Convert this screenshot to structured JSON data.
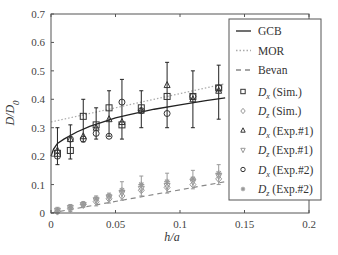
{
  "chart_data": {
    "type": "scatter",
    "title": "",
    "xlabel": "h/a",
    "ylabel": "D/D0",
    "ylabel_main": "D/D",
    "ylabel_sub": "0",
    "xlim": [
      0,
      0.2
    ],
    "ylim": [
      0,
      0.7
    ],
    "xticks": [
      0,
      0.05,
      0.1,
      0.15,
      0.2
    ],
    "xtick_labels": [
      "0",
      "0.05",
      "0.1",
      "0.15",
      "0.2"
    ],
    "yticks": [
      0,
      0.1,
      0.2,
      0.3,
      0.4,
      0.5,
      0.6,
      0.7
    ],
    "ytick_labels": [
      "0",
      "0.1",
      "0.2",
      "0.3",
      "0.4",
      "0.5",
      "0.6",
      "0.7"
    ],
    "grid": false,
    "legend_position": "upper right (outside plot edge)",
    "x": [
      0.005,
      0.015,
      0.025,
      0.035,
      0.045,
      0.055,
      0.07,
      0.09,
      0.11,
      0.13
    ],
    "lines": [
      {
        "name": "GCB",
        "style": "solid",
        "color": "#222222",
        "x": [
          0,
          0.002,
          0.005,
          0.01,
          0.02,
          0.03,
          0.04,
          0.05,
          0.06,
          0.08,
          0.1,
          0.12,
          0.135
        ],
        "y": [
          0.2,
          0.225,
          0.245,
          0.26,
          0.285,
          0.305,
          0.32,
          0.335,
          0.345,
          0.365,
          0.38,
          0.395,
          0.405
        ]
      },
      {
        "name": "MOR",
        "style": "dotted",
        "color": "#aaaaaa",
        "x": [
          0,
          0.135
        ],
        "y": [
          0.32,
          0.455
        ]
      },
      {
        "name": "Bevan",
        "style": "dashed",
        "color": "#888888",
        "x": [
          0,
          0.135
        ],
        "y": [
          0.0,
          0.11
        ]
      }
    ],
    "series": [
      {
        "name": "Dx (Sim.)",
        "label_main": "D",
        "label_sub": "x",
        "label_rest": " (Sim.)",
        "marker": "square",
        "color": "#333333",
        "values": [
          0.21,
          0.22,
          0.34,
          0.31,
          0.37,
          0.31,
          0.37,
          0.41,
          0.41,
          0.44
        ]
      },
      {
        "name": "Dz (Sim.)",
        "label_main": "D",
        "label_sub": "z",
        "label_rest": " (Sim.)",
        "marker": "diamond",
        "color": "#999999",
        "values": [
          0.005,
          0.015,
          0.03,
          0.04,
          0.05,
          0.06,
          0.08,
          0.09,
          0.1,
          0.12
        ]
      },
      {
        "name": "Dx (Exp.#1)",
        "label_main": "D",
        "label_sub": "x",
        "label_rest": " (Exp.#1)",
        "marker": "triangle-up",
        "color": "#333333",
        "values": [
          0.22,
          0.26,
          0.27,
          0.3,
          0.33,
          0.32,
          0.36,
          0.45,
          0.4,
          0.43
        ]
      },
      {
        "name": "Dz (Exp.#1)",
        "label_main": "D",
        "label_sub": "z",
        "label_rest": " (Exp.#1)",
        "marker": "triangle-down",
        "color": "#999999",
        "values": [
          0.008,
          0.018,
          0.028,
          0.045,
          0.055,
          0.07,
          0.085,
          0.095,
          0.11,
          0.13
        ]
      },
      {
        "name": "Dx (Exp.#2)",
        "label_main": "D",
        "label_sub": "x",
        "label_rest": " (Exp.#2)",
        "marker": "circle",
        "color": "#333333",
        "values": [
          0.2,
          0.26,
          0.26,
          0.28,
          0.27,
          0.39,
          0.36,
          0.35,
          0.41,
          0.44
        ]
      },
      {
        "name": "Dz (Exp.#2)",
        "label_main": "D",
        "label_sub": "z",
        "label_rest": " (Exp.#2)",
        "marker": "star",
        "color": "#999999",
        "values": [
          0.01,
          0.02,
          0.03,
          0.05,
          0.06,
          0.08,
          0.1,
          0.11,
          0.12,
          0.14
        ]
      }
    ],
    "error_bars": {
      "upper_cluster": {
        "low": [
          0.17,
          0.19,
          0.25,
          0.26,
          0.27,
          0.26,
          0.3,
          0.3,
          0.3,
          0.33
        ],
        "high": [
          0.3,
          0.31,
          0.4,
          0.37,
          0.43,
          0.47,
          0.43,
          0.53,
          0.5,
          0.52
        ]
      },
      "lower_cluster": {
        "low": [
          0.0,
          0.005,
          0.02,
          0.025,
          0.035,
          0.045,
          0.06,
          0.07,
          0.085,
          0.1
        ],
        "high": [
          0.02,
          0.03,
          0.04,
          0.06,
          0.07,
          0.11,
          0.13,
          0.14,
          0.15,
          0.17
        ]
      }
    }
  }
}
